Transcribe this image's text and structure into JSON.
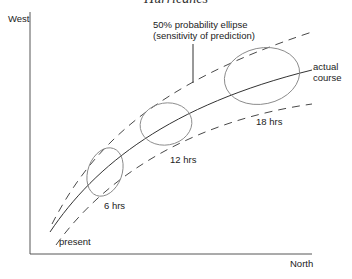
{
  "header": {
    "title": "Hurricanes"
  },
  "axes": {
    "y_label": "West",
    "x_label": "North"
  },
  "annotation": {
    "line1": "50% probability ellipse",
    "line2": "(sensitivity of prediction)"
  },
  "course_label": {
    "line1": "actual",
    "line2": "course"
  },
  "start_label": "present",
  "time_labels": [
    "6 hrs",
    "12 hrs",
    "18 hrs"
  ],
  "colors": {
    "line": "#333333",
    "ellipse": "#888888"
  }
}
